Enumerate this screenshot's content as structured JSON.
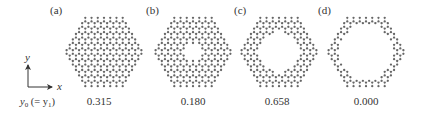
{
  "figure": {
    "panels": [
      {
        "id": "a",
        "label": "(a)",
        "value": "0.315",
        "cx": 104,
        "cy": 52,
        "hole_radius": 0
      },
      {
        "id": "b",
        "label": "(b)",
        "value": "0.180",
        "cx": 193,
        "cy": 52,
        "hole_radius": 9
      },
      {
        "id": "c",
        "label": "(c)",
        "value": "0.658",
        "cx": 279,
        "cy": 52,
        "hole_radius": 20
      },
      {
        "id": "d",
        "label": "(d)",
        "value": "0.000",
        "cx": 366,
        "cy": 52,
        "hole_radius": 27
      }
    ],
    "flake": {
      "shape": "hexagon",
      "half_width": 42,
      "half_height": 36,
      "bond_length": 3.6,
      "atom_color": "#666666",
      "atom_radius": 1.15
    },
    "axes": {
      "y_label": "y",
      "x_label": "x",
      "caption_main": "y",
      "caption_sub": "0",
      "caption_mid": " (= y",
      "caption_sub2": "1",
      "caption_end": ")"
    }
  }
}
